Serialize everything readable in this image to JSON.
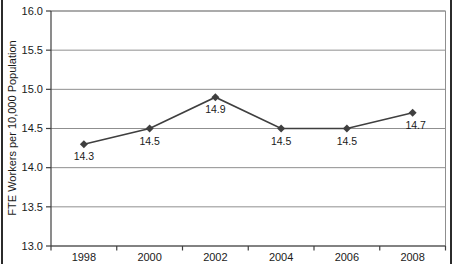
{
  "chart_data": {
    "type": "line",
    "categories": [
      "1998",
      "2000",
      "2002",
      "2004",
      "2006",
      "2008"
    ],
    "series": [
      {
        "name": "FTE Workers per 10,000 Population",
        "values": [
          14.3,
          14.5,
          14.9,
          14.5,
          14.5,
          14.7
        ]
      }
    ],
    "data_labels": [
      "14.3",
      "14.5",
      "14.9",
      "14.5",
      "14.5",
      "14.7"
    ],
    "title": "",
    "xlabel": "",
    "ylabel": "FTE Workers per 10,000 Population",
    "ylim": [
      13.0,
      16.0
    ],
    "ytick_values": [
      16.0,
      15.5,
      15.0,
      14.5,
      14.0,
      13.5,
      13.0
    ],
    "ytick_labels": [
      "16.0",
      "15.5",
      "15.0",
      "14.5",
      "14.0",
      "13.5",
      "13.0"
    ],
    "grid": true,
    "legend": "none",
    "marker": "diamond"
  },
  "colors": {
    "background": "#ffffff",
    "line": "#3f3f3f",
    "marker": "#3f3f3f",
    "gridline": "#8f8f8f",
    "plot_border": "#8f8f8f",
    "axis": "#3f3f3f",
    "label_text": "#1a1a1a",
    "frame_border": "#2b2b2b"
  }
}
